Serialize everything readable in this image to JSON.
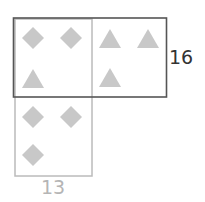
{
  "diagram": {
    "dark_box_label": "16",
    "light_box_label": "13",
    "colors": {
      "dark_box_stroke": "#555555",
      "light_box_stroke": "#bbbbbb",
      "shape_fill": "#c8c8c8",
      "dark_label": "#333333",
      "light_label": "#b5b5b5"
    },
    "dark_box": {
      "cells": [
        {
          "shapes": [
            "diamond",
            "diamond",
            "triangle"
          ]
        },
        {
          "shapes": [
            "triangle",
            "triangle",
            "triangle"
          ]
        }
      ]
    },
    "light_box": {
      "cells": [
        {
          "shapes": [
            "diamond",
            "diamond",
            "triangle"
          ]
        },
        {
          "shapes": [
            "diamond",
            "diamond",
            "diamond"
          ]
        }
      ]
    }
  }
}
